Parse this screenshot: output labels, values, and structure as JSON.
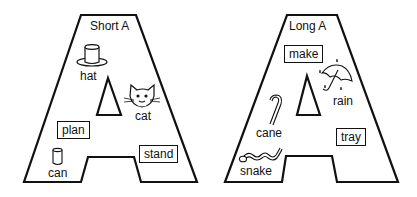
{
  "panels": [
    {
      "title": "Short A",
      "words_boxed": [
        "plan",
        "stand"
      ],
      "pictures": [
        {
          "word": "hat",
          "icon": "top-hat-icon"
        },
        {
          "word": "cat",
          "icon": "cat-face-icon"
        },
        {
          "word": "can",
          "icon": "can-icon"
        }
      ]
    },
    {
      "title": "Long A",
      "words_boxed": [
        "make",
        "tray"
      ],
      "pictures": [
        {
          "word": "rain",
          "icon": "umbrella-rain-icon"
        },
        {
          "word": "cane",
          "icon": "candy-cane-icon"
        },
        {
          "word": "snake",
          "icon": "snake-icon"
        }
      ]
    }
  ]
}
